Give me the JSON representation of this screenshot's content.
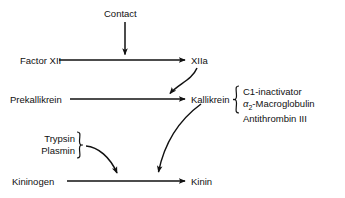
{
  "diagram": {
    "stroke_color": "#111111",
    "background_color": "#ffffff",
    "nodes": {
      "contact": "Contact",
      "factor_xii": "Factor XII",
      "xiia": "XIIa",
      "prekallikrein": "Prekallikrein",
      "kallikrein": "Kallikrein",
      "kininogen": "Kininogen",
      "kinin": "Kinin"
    },
    "activators": {
      "trypsin": "Trypsin",
      "plasmin": "Plasmin"
    },
    "inhibitors": {
      "item1": "C1-inactivator",
      "item2_prefix": "",
      "item2_greek": "α",
      "item2_sub": "2",
      "item2_rest": "-Macroglobulin",
      "item3": "Antithrombin III"
    }
  }
}
